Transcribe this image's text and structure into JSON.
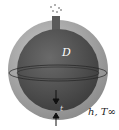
{
  "diagram": {
    "inner_label": "D",
    "thickness_label": "t",
    "ambient_label": "h, T∞",
    "colors": {
      "outer_shell": "#9a9a9a",
      "inner_sphere": "#4a4a4a",
      "vent": "#5a5a5a",
      "text_inner": "#ffffff",
      "text_outer": "#222222"
    }
  }
}
